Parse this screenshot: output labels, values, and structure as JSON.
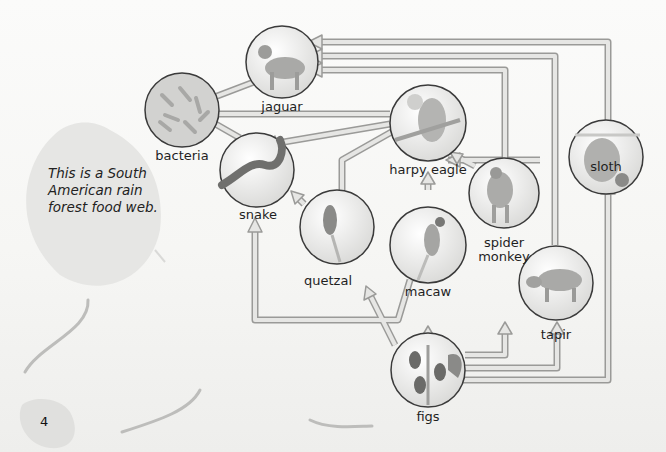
{
  "caption": "This is a South American rain forest food web.",
  "page_number": "4",
  "colors": {
    "arrow_fill": "#e4e4e2",
    "arrow_outline": "#9a9a98",
    "circle_outline": "#3a3a3a",
    "leaf": "#d8d8d6"
  },
  "nodes": {
    "jaguar": "jaguar",
    "bacteria": "bacteria",
    "harpy_eagle": "harpy eagle",
    "sloth": "sloth",
    "snake": "snake",
    "quetzal": "quetzal",
    "macaw": "macaw",
    "spider_monkey_line1": "spider",
    "spider_monkey_line2": "monkey",
    "tapir": "tapir",
    "figs": "figs"
  },
  "edges": [
    {
      "from": "jaguar",
      "to": "bacteria"
    },
    {
      "from": "harpy eagle",
      "to": "bacteria"
    },
    {
      "from": "snake",
      "to": "bacteria"
    },
    {
      "from": "harpy eagle",
      "to": "snake"
    },
    {
      "from": "sloth",
      "to": "harpy eagle"
    },
    {
      "from": "spider monkey",
      "to": "harpy eagle"
    },
    {
      "from": "quetzal",
      "to": "harpy eagle"
    },
    {
      "from": "macaw",
      "to": "harpy eagle"
    },
    {
      "from": "sloth",
      "to": "jaguar"
    },
    {
      "from": "tapir",
      "to": "jaguar"
    },
    {
      "from": "spider monkey",
      "to": "jaguar"
    },
    {
      "from": "quetzal",
      "to": "snake"
    },
    {
      "from": "macaw",
      "to": "snake"
    },
    {
      "from": "figs",
      "to": "quetzal"
    },
    {
      "from": "figs",
      "to": "macaw"
    },
    {
      "from": "figs",
      "to": "spider monkey"
    },
    {
      "from": "figs",
      "to": "tapir"
    },
    {
      "from": "figs",
      "to": "sloth"
    }
  ]
}
